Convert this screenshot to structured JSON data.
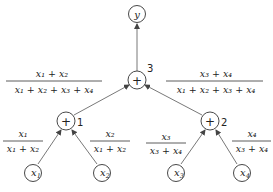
{
  "diagram": {
    "type": "computation-tree",
    "nodes": {
      "output": {
        "label": "y"
      },
      "sum3": {
        "symbol": "+",
        "index": "3"
      },
      "sum1": {
        "symbol": "+",
        "index": "1"
      },
      "sum2": {
        "symbol": "+",
        "index": "2"
      },
      "x1": {
        "var": "x",
        "sub": "1"
      },
      "x2": {
        "var": "x",
        "sub": "2"
      },
      "x3": {
        "var": "x",
        "sub": "3"
      },
      "x4": {
        "var": "x",
        "sub": "4"
      }
    },
    "edge_weights": {
      "sum1_to_sum3": {
        "numerator": "x₁ + x₂",
        "denominator": "x₁ + x₂ + x₃ + x₄"
      },
      "sum2_to_sum3": {
        "numerator": "x₃ + x₄",
        "denominator": "x₁ + x₂ + x₃ + x₄"
      },
      "x1_to_sum1": {
        "numerator": "x₁",
        "denominator": "x₁ + x₂"
      },
      "x2_to_sum1": {
        "numerator": "x₂",
        "denominator": "x₁ + x₂"
      },
      "x3_to_sum2": {
        "numerator": "x₃",
        "denominator": "x₃ + x₄"
      },
      "x4_to_sum2": {
        "numerator": "x₄",
        "denominator": "x₃ + x₄"
      }
    }
  }
}
